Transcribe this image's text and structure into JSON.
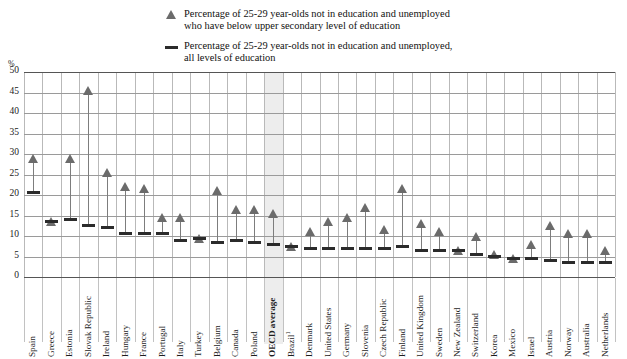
{
  "legend": {
    "series1": {
      "symbol": "triangle-marker",
      "line1": "Percentage of 25-29 year-olds not in education and unemployed",
      "line2": "who have below upper secondary level of education"
    },
    "series2": {
      "symbol": "dash-marker",
      "line1": "Percentage of 25-29 year-olds not in education and unemployed,",
      "line2": "all levels of education"
    }
  },
  "axis": {
    "unit": "%",
    "yticks": [
      "0",
      "5",
      "10",
      "15",
      "20",
      "25",
      "30",
      "35",
      "40",
      "45",
      "50"
    ]
  },
  "colors": {
    "triangle": "#6b6b6b",
    "dash": "#2b2b2b",
    "stem": "#7d7d7d",
    "grid": "#9a9a9a",
    "highlight_band": "#ededed"
  },
  "chart_data": {
    "type": "scatter",
    "title": "",
    "xlabel": "",
    "ylabel": "%",
    "ylim": [
      0,
      50
    ],
    "ytick_step": 5,
    "grid": true,
    "legend_position": "top",
    "highlight_category": "OECD average",
    "categories": [
      "Spain",
      "Greece",
      "Estonia",
      "Slovak Republic",
      "Ireland",
      "Hungary",
      "France",
      "Portugal",
      "Italy",
      "Turkey",
      "Belgium",
      "Canada",
      "Poland",
      "OECD average",
      "Brazil",
      "Denmark",
      "United States",
      "Germany",
      "Slovenia",
      "Czech Republic",
      "Finland",
      "United Kingdom",
      "Sweden",
      "New Zealand",
      "Switzerland",
      "Korea",
      "Mexico",
      "Israel",
      "Austria",
      "Norway",
      "Australia",
      "Netherlands"
    ],
    "category_notes": {
      "Brazil": "1"
    },
    "series": [
      {
        "name": "Percentage of 25-29 year-olds not in education and unemployed who have below upper secondary level of education",
        "marker": "triangle",
        "values": [
          29.0,
          13.5,
          29.0,
          45.5,
          25.5,
          22.0,
          21.5,
          14.5,
          14.5,
          9.5,
          21.0,
          16.5,
          16.5,
          15.5,
          7.5,
          11.0,
          13.5,
          14.5,
          17.0,
          11.5,
          21.5,
          13.0,
          11.0,
          6.5,
          10.0,
          5.5,
          4.5,
          8.0,
          12.5,
          10.5,
          10.5,
          6.5
        ]
      },
      {
        "name": "Percentage of 25-29 year-olds not in education and unemployed, all levels of education",
        "marker": "dash",
        "values": [
          20.5,
          13.5,
          14.0,
          12.5,
          12.0,
          10.5,
          10.5,
          10.5,
          9.0,
          9.5,
          8.5,
          9.0,
          8.5,
          8.0,
          7.5,
          7.0,
          7.0,
          7.0,
          7.0,
          7.0,
          7.5,
          6.5,
          6.5,
          6.5,
          5.5,
          5.0,
          4.5,
          4.5,
          4.0,
          3.5,
          3.5,
          3.5
        ]
      }
    ]
  }
}
